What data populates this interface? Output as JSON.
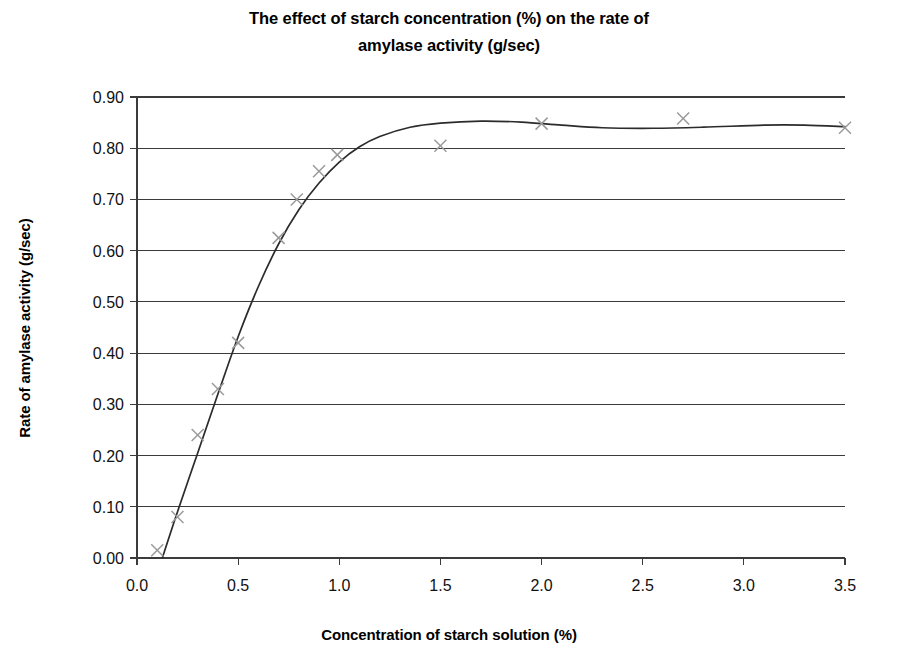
{
  "chart_data": {
    "type": "scatter",
    "title": "The effect of starch concentration (%) on the rate of amylase activity (g/sec)",
    "title_line1": "The effect of starch concentration (%) on the rate of",
    "title_line2": "amylase activity (g/sec)",
    "xlabel": "Concentration of starch solution (%)",
    "ylabel": "Rate of amylase activity (g/sec)",
    "xlim": [
      0.0,
      3.5
    ],
    "ylim": [
      0.0,
      0.9
    ],
    "grid": "horizontal",
    "legend": "none",
    "marker_style": "x",
    "marker_color": "#9a9a9a",
    "curve_color": "#2b2b2b",
    "x_ticks": [
      "0.0",
      "0.5",
      "1.0",
      "1.5",
      "2.0",
      "2.5",
      "3.0",
      "3.5"
    ],
    "x_tick_values": [
      0.0,
      0.5,
      1.0,
      1.5,
      2.0,
      2.5,
      3.0,
      3.5
    ],
    "y_ticks": [
      "0.00",
      "0.10",
      "0.20",
      "0.30",
      "0.40",
      "0.50",
      "0.60",
      "0.70",
      "0.80",
      "0.90"
    ],
    "y_tick_values": [
      0.0,
      0.1,
      0.2,
      0.3,
      0.4,
      0.5,
      0.6,
      0.7,
      0.8,
      0.9
    ],
    "points": [
      {
        "x": 0.1,
        "y": 0.015
      },
      {
        "x": 0.2,
        "y": 0.08
      },
      {
        "x": 0.3,
        "y": 0.24
      },
      {
        "x": 0.4,
        "y": 0.33
      },
      {
        "x": 0.5,
        "y": 0.42
      },
      {
        "x": 0.7,
        "y": 0.625
      },
      {
        "x": 0.79,
        "y": 0.7
      },
      {
        "x": 0.9,
        "y": 0.755
      },
      {
        "x": 0.99,
        "y": 0.787
      },
      {
        "x": 1.5,
        "y": 0.805
      },
      {
        "x": 2.0,
        "y": 0.848
      },
      {
        "x": 2.7,
        "y": 0.858
      },
      {
        "x": 3.5,
        "y": 0.84
      }
    ],
    "curve": [
      {
        "x": 0.125,
        "y": 0.0
      },
      {
        "x": 0.2,
        "y": 0.09
      },
      {
        "x": 0.3,
        "y": 0.205
      },
      {
        "x": 0.4,
        "y": 0.32
      },
      {
        "x": 0.5,
        "y": 0.432
      },
      {
        "x": 0.6,
        "y": 0.53
      },
      {
        "x": 0.7,
        "y": 0.613
      },
      {
        "x": 0.8,
        "y": 0.68
      },
      {
        "x": 0.9,
        "y": 0.732
      },
      {
        "x": 1.0,
        "y": 0.773
      },
      {
        "x": 1.1,
        "y": 0.803
      },
      {
        "x": 1.2,
        "y": 0.823
      },
      {
        "x": 1.35,
        "y": 0.841
      },
      {
        "x": 1.5,
        "y": 0.849
      },
      {
        "x": 1.7,
        "y": 0.853
      },
      {
        "x": 1.9,
        "y": 0.851
      },
      {
        "x": 2.1,
        "y": 0.845
      },
      {
        "x": 2.3,
        "y": 0.84
      },
      {
        "x": 2.55,
        "y": 0.839
      },
      {
        "x": 2.8,
        "y": 0.841
      },
      {
        "x": 3.1,
        "y": 0.845
      },
      {
        "x": 3.3,
        "y": 0.845
      },
      {
        "x": 3.5,
        "y": 0.842
      }
    ]
  }
}
